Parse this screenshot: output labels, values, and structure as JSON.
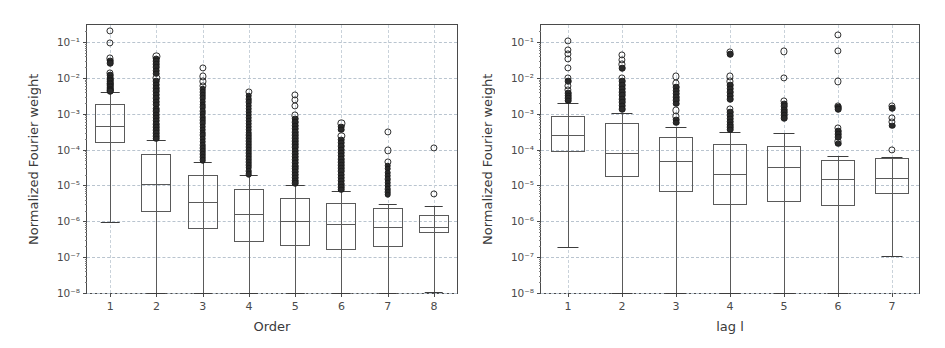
{
  "figure": {
    "background": "#ffffff",
    "panel_count": 2
  },
  "chart_data": [
    {
      "type": "box",
      "panel": "left",
      "title": "",
      "xlabel": "Order",
      "ylabel": "Normalized Fourier weight",
      "yscale": "log",
      "ylim": [
        1e-08,
        0.3
      ],
      "grid": true,
      "grid_axis": "both",
      "legend": null,
      "ytick_labels": [
        "10⁻¹",
        "10⁻²",
        "10⁻³",
        "10⁻⁴",
        "10⁻⁵",
        "10⁻⁶",
        "10⁻⁷",
        "10⁻⁸"
      ],
      "ytick_values": [
        0.1,
        0.01,
        0.001,
        0.0001,
        1e-05,
        1e-06,
        1e-07,
        1e-08
      ],
      "categories": [
        "1",
        "2",
        "3",
        "4",
        "5",
        "6",
        "7",
        "8"
      ],
      "boxes": [
        {
          "category": "1",
          "whisker_low": 9.5e-07,
          "q1": 0.00015,
          "median": 0.00045,
          "q3": 0.0019,
          "whisker_high": 0.004,
          "fliers": [
            0.2,
            0.095,
            0.035,
            0.03,
            0.026,
            0.014,
            0.012,
            0.01,
            0.009,
            0.008,
            0.0072,
            0.0066,
            0.006,
            0.0055,
            0.005,
            0.0047,
            0.0044,
            0.0042
          ]
        },
        {
          "category": "2",
          "whisker_low": 1e-08,
          "q1": 1.8e-06,
          "median": 1.1e-05,
          "q3": 7.5e-05,
          "whisker_high": 0.00018,
          "fliers": [
            0.04,
            0.034,
            0.029,
            0.024,
            0.02,
            0.016,
            0.013,
            0.01,
            0.008,
            0.0065,
            0.0052,
            0.0042,
            0.0034,
            0.0027,
            0.0022,
            0.0018,
            0.0014,
            0.0012,
            0.00095,
            0.00078,
            0.00064,
            0.00052,
            0.00043,
            0.00035,
            0.00029,
            0.00024,
            0.0002
          ]
        },
        {
          "category": "3",
          "whisker_low": 1e-08,
          "q1": 6e-07,
          "median": 3.5e-06,
          "q3": 1.9e-05,
          "whisker_high": 4.5e-05,
          "fliers": [
            0.019,
            0.011,
            0.008,
            0.006,
            0.0048,
            0.004,
            0.0033,
            0.0027,
            0.0022,
            0.0018,
            0.0015,
            0.0012,
            0.001,
            0.0008,
            0.00066,
            0.00054,
            0.00044,
            0.00036,
            0.0003,
            0.00025,
            0.0002,
            0.000165,
            0.000135,
            0.00011,
            9e-05,
            7.4e-05,
            6.1e-05,
            5e-05
          ]
        },
        {
          "category": "4",
          "whisker_low": 1e-08,
          "q1": 2.7e-07,
          "median": 1.6e-06,
          "q3": 7.8e-06,
          "whisker_high": 1.9e-05,
          "fliers": [
            0.004,
            0.0032,
            0.0026,
            0.0021,
            0.0017,
            0.0014,
            0.00115,
            0.00095,
            0.00078,
            0.00064,
            0.00053,
            0.00044,
            0.00036,
            0.0003,
            0.00025,
            0.000205,
            0.00017,
            0.00014,
            0.000115,
            9.5e-05,
            7.9e-05,
            6.5e-05,
            5.4e-05,
            4.5e-05,
            3.7e-05,
            3.1e-05,
            2.5e-05,
            2.1e-05
          ]
        },
        {
          "category": "5",
          "whisker_low": 1e-08,
          "q1": 2e-07,
          "median": 1.05e-06,
          "q3": 4.5e-06,
          "whisker_high": 1e-05,
          "fliers": [
            0.0034,
            0.0025,
            0.0017,
            0.0009,
            0.00072,
            0.00058,
            0.00047,
            0.00038,
            0.00031,
            0.00025,
            0.000205,
            0.00017,
            0.00014,
            0.000115,
            9.4e-05,
            7.7e-05,
            6.3e-05,
            5.2e-05,
            4.3e-05,
            3.5e-05,
            2.9e-05,
            2.4e-05,
            2e-05,
            1.65e-05,
            1.35e-05,
            1.15e-05
          ]
        },
        {
          "category": "6",
          "whisker_low": 1e-08,
          "q1": 1.6e-07,
          "median": 8.5e-07,
          "q3": 3.2e-06,
          "whisker_high": 6.8e-06,
          "fliers": [
            0.00054,
            0.00044,
            0.00036,
            0.00024,
            0.00019,
            0.000155,
            0.000125,
            0.0001,
            8.2e-05,
            6.7e-05,
            5.5e-05,
            4.5e-05,
            3.7e-05,
            3e-05,
            2.5e-05,
            2e-05,
            1.65e-05,
            1.35e-05,
            1.1e-05,
            9e-06,
            7.6e-06
          ]
        },
        {
          "category": "7",
          "whisker_low": 1e-08,
          "q1": 1.9e-07,
          "median": 7e-07,
          "q3": 2.4e-06,
          "whisker_high": 3e-06,
          "fliers": [
            0.00032,
            9.5e-05,
            4.6e-05,
            3.6e-05,
            2.9e-05,
            2.3e-05,
            1.85e-05,
            1.5e-05,
            1.2e-05,
            9.8e-06,
            8e-06,
            6.6e-06,
            5.5e-06
          ]
        },
        {
          "category": "8",
          "whisker_low": 1.1e-08,
          "q1": 4.8e-07,
          "median": 6.8e-07,
          "q3": 1.5e-06,
          "whisker_high": 2.6e-06,
          "fliers": [
            0.00011,
            5.8e-06
          ]
        }
      ]
    },
    {
      "type": "box",
      "panel": "right",
      "title": "",
      "xlabel": "lag l",
      "ylabel": "Normalized Fourier weight",
      "yscale": "log",
      "ylim": [
        1e-08,
        0.3
      ],
      "grid": true,
      "grid_axis": "both",
      "legend": null,
      "ytick_labels": [
        "10⁻¹",
        "10⁻²",
        "10⁻³",
        "10⁻⁴",
        "10⁻⁵",
        "10⁻⁶",
        "10⁻⁷",
        "10⁻⁸"
      ],
      "ytick_values": [
        0.1,
        0.01,
        0.001,
        0.0001,
        1e-05,
        1e-06,
        1e-07,
        1e-08
      ],
      "categories": [
        "1",
        "2",
        "3",
        "4",
        "5",
        "6",
        "7"
      ],
      "boxes": [
        {
          "category": "1",
          "whisker_low": 1.9e-07,
          "q1": 8.5e-05,
          "median": 0.00026,
          "q3": 0.00088,
          "whisker_high": 0.002,
          "fliers": [
            0.11,
            0.06,
            0.046,
            0.034,
            0.019,
            0.01,
            0.0082,
            0.006,
            0.0046,
            0.0038,
            0.0032,
            0.0027,
            0.0023
          ]
        },
        {
          "category": "2",
          "whisker_low": 1e-08,
          "q1": 1.7e-05,
          "median": 8e-05,
          "q3": 0.00055,
          "whisker_high": 0.00105,
          "fliers": [
            0.043,
            0.032,
            0.024,
            0.019,
            0.01,
            0.008,
            0.0062,
            0.005,
            0.004,
            0.0033,
            0.0026,
            0.0021,
            0.0017,
            0.00135
          ]
        },
        {
          "category": "3",
          "whisker_low": 1e-08,
          "q1": 6.5e-06,
          "median": 4.8e-05,
          "q3": 0.00022,
          "whisker_high": 0.00044,
          "fliers": [
            0.011,
            0.007,
            0.0055,
            0.0044,
            0.0036,
            0.0029,
            0.0024,
            0.0019,
            0.00125,
            0.00085,
            0.00068,
            0.00056
          ]
        },
        {
          "category": "4",
          "whisker_low": 1e-08,
          "q1": 2.8e-06,
          "median": 2.1e-05,
          "q3": 0.000145,
          "whisker_high": 0.00031,
          "fliers": [
            0.052,
            0.046,
            0.011,
            0.008,
            0.0062,
            0.005,
            0.004,
            0.0032,
            0.0026,
            0.0014,
            0.0011,
            0.00088,
            0.00072,
            0.0006,
            0.0005,
            0.00042,
            0.00036
          ]
        },
        {
          "category": "5",
          "whisker_low": 1e-08,
          "q1": 3.4e-06,
          "median": 3.2e-05,
          "q3": 0.00013,
          "whisker_high": 0.0003,
          "fliers": [
            0.055,
            0.01,
            0.0023,
            0.0019,
            0.0016,
            0.0013,
            0.0011,
            0.0009,
            0.00075
          ]
        },
        {
          "category": "6",
          "whisker_low": 1e-08,
          "q1": 2.6e-06,
          "median": 1.5e-05,
          "q3": 5.2e-05,
          "whisker_high": 6.6e-05,
          "fliers": [
            0.16,
            0.056,
            0.008,
            0.0017,
            0.0015,
            0.00135,
            0.0004,
            0.00033,
            0.00027,
            0.00022,
            0.00017,
            0.000145
          ]
        },
        {
          "category": "7",
          "whisker_low": 1.05e-07,
          "q1": 5.8e-06,
          "median": 1.6e-05,
          "q3": 5.8e-05,
          "whisker_high": 6.4e-05,
          "fliers": [
            0.0017,
            0.00145,
            0.00075,
            0.00058,
            0.00046,
            0.0001
          ]
        }
      ]
    }
  ]
}
